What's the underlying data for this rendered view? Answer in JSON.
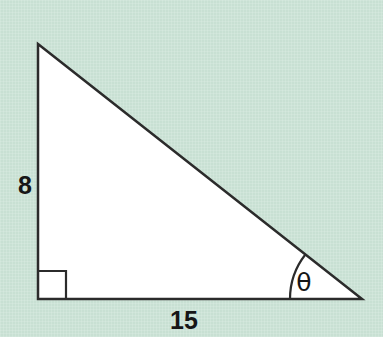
{
  "figure": {
    "kind": "right-triangle-diagram",
    "background_color": "#cbe3d6",
    "fill_color": "#ffffff",
    "stroke_color": "#2b2b2b",
    "label_color": "#161616",
    "stroke_width": 2.5
  },
  "chart_data": {
    "type": "diagram",
    "title": "",
    "shape": "right triangle",
    "vertices": {
      "apex": [
        38,
        44
      ],
      "right_angle": [
        38,
        299
      ],
      "angle_theta": [
        362,
        299
      ]
    },
    "sides": [
      {
        "name": "vertical-leg",
        "label": "8",
        "value": 8,
        "from": [
          38,
          44
        ],
        "to": [
          38,
          299
        ]
      },
      {
        "name": "horizontal-leg",
        "label": "15",
        "value": 15,
        "from": [
          38,
          299
        ],
        "to": [
          362,
          299
        ]
      },
      {
        "name": "hypotenuse",
        "label": "",
        "value": 17,
        "from": [
          38,
          44
        ],
        "to": [
          362,
          299
        ]
      }
    ],
    "angles": [
      {
        "name": "right-angle",
        "label": "",
        "marker": "square",
        "at": [
          38,
          299
        ],
        "degrees": 90
      },
      {
        "name": "theta",
        "label": "θ",
        "marker": "arc",
        "at": [
          362,
          299
        ],
        "degrees": 28
      }
    ],
    "annotations": [
      "8",
      "15",
      "θ"
    ]
  },
  "labels": {
    "vertical_leg": "8",
    "horizontal_leg": "15",
    "angle": "θ"
  },
  "geometry": {
    "apex_x": 38,
    "apex_y": 44,
    "left_x": 38,
    "base_y": 299,
    "right_x": 362,
    "square_size": 28,
    "arc_radius": 72
  }
}
